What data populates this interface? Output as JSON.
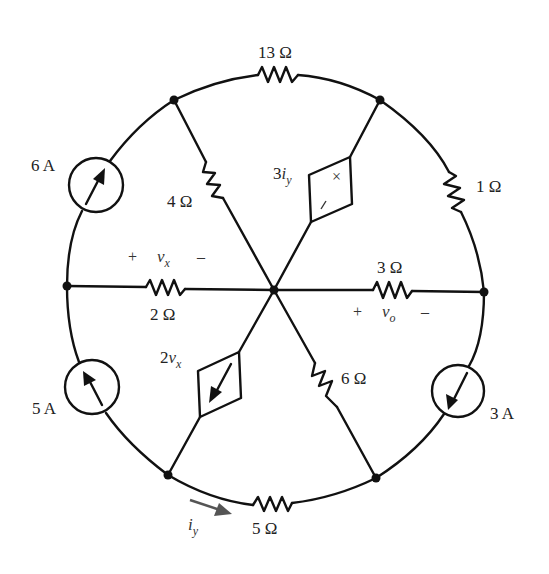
{
  "figure": {
    "type": "circuit-schematic",
    "nodes": [
      "top-left",
      "top-right",
      "right",
      "bottom-right",
      "bottom-left",
      "left",
      "center"
    ],
    "components": {
      "r13": {
        "label_value": "13",
        "unit": "Ω",
        "between": [
          "top-left",
          "top-right"
        ]
      },
      "r1": {
        "label_value": "1",
        "unit": "Ω",
        "between": [
          "top-right",
          "right"
        ]
      },
      "i3": {
        "label_value": "3",
        "unit": "A",
        "between": [
          "right",
          "bottom-right"
        ],
        "direction": "toward bottom-right"
      },
      "r5": {
        "label_value": "5",
        "unit": "Ω",
        "between": [
          "bottom-right",
          "bottom-left"
        ]
      },
      "i5": {
        "label_value": "5",
        "unit": "A",
        "between": [
          "bottom-left",
          "left"
        ],
        "direction": "toward left"
      },
      "i6": {
        "label_value": "6",
        "unit": "A",
        "between": [
          "left",
          "top-left"
        ],
        "direction": "toward top-left"
      },
      "r4": {
        "label_value": "4",
        "unit": "Ω",
        "between": [
          "top-left",
          "center"
        ]
      },
      "vs3iy": {
        "label_coef": "3",
        "label_var": "i",
        "label_sub": "y",
        "between": [
          "top-right",
          "center"
        ],
        "plus": "+",
        "minus": "/",
        "kind": "dependent voltage source"
      },
      "r3": {
        "label_value": "3",
        "unit": "Ω",
        "between": [
          "center",
          "right"
        ]
      },
      "r6": {
        "label_value": "6",
        "unit": "Ω",
        "between": [
          "center",
          "bottom-right"
        ]
      },
      "cs2vx": {
        "label_coef": "2",
        "label_var": "v",
        "label_sub": "x",
        "between": [
          "center",
          "bottom-left"
        ],
        "kind": "dependent current source",
        "direction": "toward bottom-left"
      },
      "r2": {
        "label_value": "2",
        "unit": "Ω",
        "between": [
          "left",
          "center"
        ]
      }
    },
    "annotations": {
      "vx": {
        "plus": "+",
        "var": "v",
        "sub": "x",
        "minus": "–"
      },
      "vo": {
        "plus": "+",
        "var": "v",
        "sub": "o",
        "minus": "–"
      },
      "iy": {
        "var": "i",
        "sub": "y",
        "arrow_color": "#555555"
      }
    },
    "colors": {
      "wire": "#111111",
      "label": "#222222",
      "background": "#ffffff"
    }
  }
}
